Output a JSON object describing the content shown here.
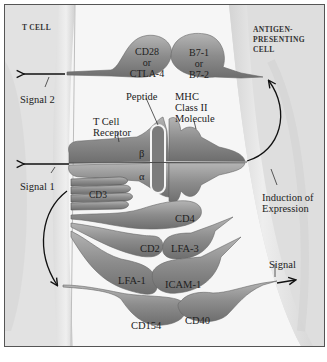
{
  "diagram": {
    "regions": {
      "t_cell": "T CELL",
      "apc_line1": "ANTIGEN-",
      "apc_line2": "PRESENTING",
      "apc_line3": "CELL"
    },
    "molecules": {
      "cd28_line1": "CD28",
      "cd28_line2": "or",
      "cd28_line3": "CTLA-4",
      "b7_line1": "B7-1",
      "b7_line2": "or",
      "b7_line3": "B7-2",
      "tcr_line1": "T Cell",
      "tcr_line2": "Receptor",
      "peptide": "Peptide",
      "mhc_line1": "MHC",
      "mhc_line2": "Class II",
      "mhc_line3": "Molecule",
      "beta": "β",
      "alpha": "α",
      "cd3": "CD3",
      "cd4": "CD4",
      "cd2": "CD2",
      "lfa3": "LFA-3",
      "lfa1": "LFA-1",
      "icam1": "ICAM-1",
      "cd154": "CD154",
      "cd40": "CD40"
    },
    "signals": {
      "signal2": "Signal 2",
      "signal1": "Signal 1",
      "signal": "Signal",
      "induction_line1": "Induction of",
      "induction_line2": "Expression"
    },
    "colors": {
      "molecule_fill": "#8f8f8f",
      "molecule_dark": "#6a6a6a",
      "membrane": "#e6e6e6",
      "background": "#f4f4f4",
      "text": "#222222"
    }
  }
}
